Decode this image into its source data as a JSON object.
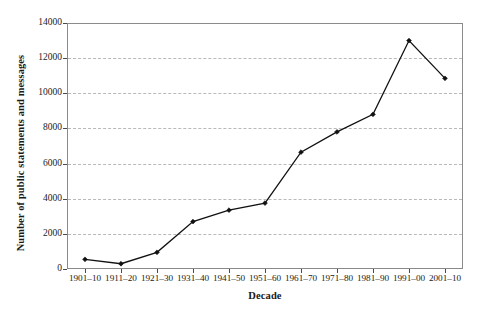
{
  "chart_data": {
    "type": "line",
    "title": "",
    "xlabel": "Decade",
    "ylabel": "Number of public statements and messages",
    "categories": [
      "1901–10",
      "1911–20",
      "1921–30",
      "1931–40",
      "1941–50",
      "1951–60",
      "1961–70",
      "1971–80",
      "1981–90",
      "1991–00",
      "2001–10"
    ],
    "values": [
      550,
      300,
      950,
      2700,
      3350,
      3750,
      6650,
      7800,
      8800,
      13000,
      10850
    ],
    "series": [
      {
        "name": "Number of public statements and messages",
        "values": [
          550,
          300,
          950,
          2700,
          3350,
          3750,
          6650,
          7800,
          8800,
          13000,
          10850
        ]
      }
    ],
    "ylim": [
      0,
      14000
    ],
    "yticks": [
      0,
      2000,
      4000,
      6000,
      8000,
      10000,
      12000,
      14000
    ],
    "ytick_labels": [
      "0",
      "2000",
      "4000",
      "6000",
      "8000",
      "10000",
      "12000",
      "14000"
    ],
    "grid": true,
    "grid_axis": "y",
    "grid_style": "dashed",
    "legend": false,
    "legend_position": "none",
    "marker": "diamond",
    "line_color": "#111111",
    "marker_color": "#111111",
    "grid_color": "#b9b9b9",
    "frame_color": "#8a8a8a",
    "background_color": "#ffffff"
  }
}
